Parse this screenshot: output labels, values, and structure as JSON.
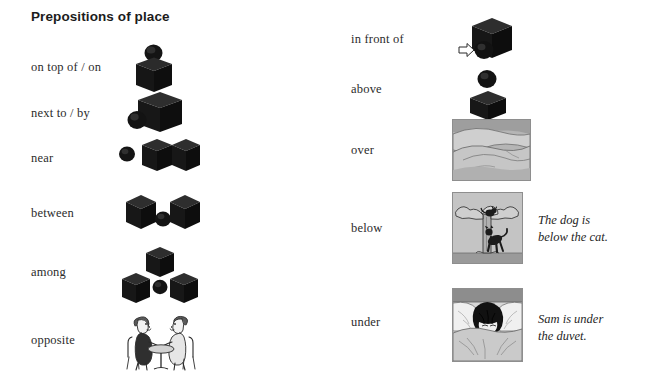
{
  "title": "Prepositions of place",
  "colors": {
    "object_dark": "#1a1a1a",
    "object_mid": "#3a3a3a",
    "panel_border": "#8e8e8e",
    "panel_sky": "#b3b3b3",
    "text": "#2b2b2b"
  },
  "left_column": [
    {
      "label": "on top of / on",
      "illustration": "sphere-on-top-of-cube",
      "description": "A sphere resting on the top face of a cube."
    },
    {
      "label": "next to / by",
      "illustration": "sphere-next-to-cube",
      "description": "A sphere positioned at the lower-left side of a cube."
    },
    {
      "label": "near",
      "illustration": "sphere-near-two-cubes",
      "description": "A small sphere to the left of two cubes."
    },
    {
      "label": "between",
      "illustration": "sphere-between-two-cubes",
      "description": "A sphere placed between two cubes."
    },
    {
      "label": "among",
      "illustration": "sphere-among-three-cubes",
      "description": "A sphere surrounded by three cubes."
    },
    {
      "label": "opposite",
      "illustration": "two-people-facing-across-table",
      "description": "Two people sitting opposite each other at a small round table."
    }
  ],
  "right_column": [
    {
      "label": "in front of",
      "illustration": "sphere-in-front-of-cube-with-arrow",
      "description": "A sphere in front of a cube, with a hollow arrow showing the viewing direction.",
      "caption": ""
    },
    {
      "label": "above",
      "illustration": "sphere-above-cube",
      "description": "A sphere floating above a cube with a gap between them.",
      "caption": ""
    },
    {
      "label": "over",
      "illustration": "duvet-draped-over-bed",
      "description": "Grayscale picture of a duvet draped over a bed.",
      "caption": ""
    },
    {
      "label": "below",
      "illustration": "dog-below-cat-in-tree",
      "description": "Grayscale picture of a cat up a tree with a dog jumping at the trunk below.",
      "caption": "The dog is\nbelow the cat."
    },
    {
      "label": "under",
      "illustration": "boy-under-duvet",
      "description": "Grayscale picture of a boy in bed pulling the duvet up over his face.",
      "caption": "Sam is under\nthe duvet."
    }
  ]
}
